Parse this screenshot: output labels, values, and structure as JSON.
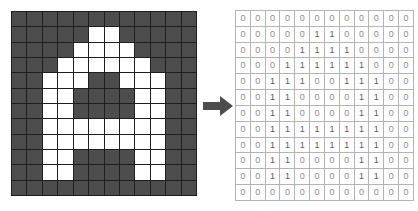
{
  "figure": {
    "arrow_icon": "arrow-right-icon",
    "arrow_color": "#4d4d4d",
    "pixel_off_color": "#4d4d4d",
    "pixel_on_color": "#ffffff",
    "gridline_color": "#1f1f1f",
    "table_border_color": "#b4b4b4",
    "table_text_color": "#8c8c8c",
    "rows": 12,
    "cols": 12,
    "value_labels": [
      "0",
      "1"
    ]
  },
  "chart_data": {
    "type": "heatmap",
    "title": "",
    "xlabel": "",
    "ylabel": "",
    "rows": 12,
    "cols": 12,
    "value_map": {
      "0": "dark-gray-pixel",
      "1": "white-pixel"
    },
    "matrix": [
      [
        0,
        0,
        0,
        0,
        0,
        0,
        0,
        0,
        0,
        0,
        0,
        0
      ],
      [
        0,
        0,
        0,
        0,
        0,
        1,
        1,
        0,
        0,
        0,
        0,
        0
      ],
      [
        0,
        0,
        0,
        0,
        1,
        1,
        1,
        1,
        0,
        0,
        0,
        0
      ],
      [
        0,
        0,
        0,
        1,
        1,
        1,
        1,
        1,
        1,
        0,
        0,
        0
      ],
      [
        0,
        0,
        1,
        1,
        1,
        0,
        0,
        1,
        1,
        1,
        0,
        0
      ],
      [
        0,
        0,
        1,
        1,
        0,
        0,
        0,
        0,
        1,
        1,
        0,
        0
      ],
      [
        0,
        0,
        1,
        1,
        0,
        0,
        0,
        0,
        1,
        1,
        0,
        0
      ],
      [
        0,
        0,
        1,
        1,
        1,
        1,
        1,
        1,
        1,
        1,
        0,
        0
      ],
      [
        0,
        0,
        1,
        1,
        1,
        1,
        1,
        1,
        1,
        1,
        0,
        0
      ],
      [
        0,
        0,
        1,
        1,
        0,
        0,
        0,
        0,
        1,
        1,
        0,
        0
      ],
      [
        0,
        0,
        1,
        1,
        0,
        0,
        0,
        0,
        1,
        1,
        0,
        0
      ],
      [
        0,
        0,
        0,
        0,
        0,
        0,
        0,
        0,
        0,
        0,
        0,
        0
      ]
    ]
  }
}
